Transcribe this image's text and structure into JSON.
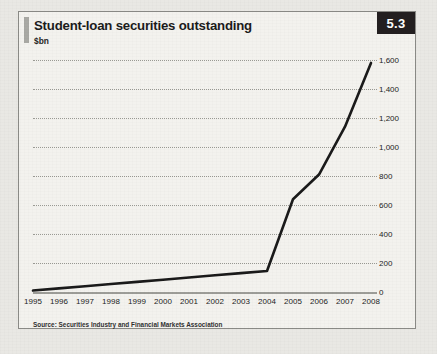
{
  "figure": {
    "badge": "5.3",
    "title": "Student-loan securities outstanding",
    "subtitle": "$bn",
    "source": "Source: Securities Industry and Financial Markets Association"
  },
  "colors": {
    "badge_background": "#231f20",
    "badge_text": "#ffffff",
    "line": "#1a1a1a",
    "grid": "#9a9a94",
    "panel_background": "#f3f2ee",
    "page_background": "#e9e8e4"
  },
  "chart_data": {
    "type": "line",
    "title": "Student-loan securities outstanding",
    "subtitle": "$bn",
    "xlabel": "",
    "ylabel": "$bn",
    "ylim": [
      0,
      1600
    ],
    "yticks": [
      0,
      200,
      400,
      600,
      800,
      1000,
      1200,
      1400,
      1600
    ],
    "ytick_labels": [
      "0",
      "200",
      "400",
      "600",
      "800",
      "1,000",
      "1,200",
      "1,400",
      "1,600"
    ],
    "categories": [
      "1995",
      "1996",
      "1997",
      "1998",
      "1999",
      "2000",
      "2001",
      "2002",
      "2003",
      "2004",
      "2005",
      "2006",
      "2007",
      "2008"
    ],
    "values": [
      10,
      25,
      40,
      55,
      70,
      85,
      100,
      115,
      130,
      145,
      640,
      810,
      1140,
      1580
    ],
    "grid": true,
    "grid_style": "dotted-horizontal",
    "legend": false,
    "y_axis_position": "right",
    "source": "Source: Securities Industry and Financial Markets Association"
  }
}
